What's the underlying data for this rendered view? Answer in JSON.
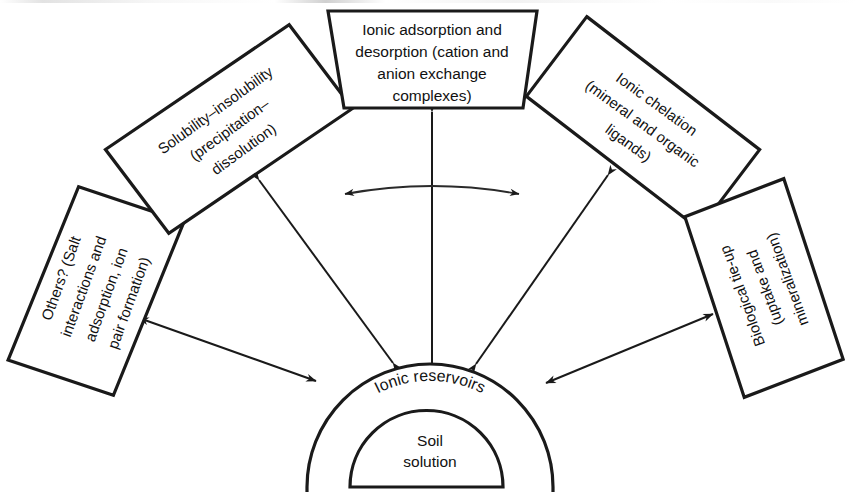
{
  "figure": {
    "type": "relationship-diagram"
  },
  "center": {
    "outer_label": "Ionic reservoirs",
    "inner_label_line1": "Soil",
    "inner_label_line2": "solution"
  },
  "nodes": [
    {
      "id": "others",
      "name": "others-salt-interactions-box",
      "lines": [
        "Others? (Salt",
        "interactions and",
        "adsorption, ion",
        "pair formation)"
      ],
      "rotation": -72
    },
    {
      "id": "solubility",
      "name": "solubility-insolubility-box",
      "lines": [
        "Solubility–insolubility",
        "(precipitation–",
        "dissolution)"
      ],
      "rotation": -36
    },
    {
      "id": "adsorption",
      "name": "ionic-adsorption-desorption-box",
      "lines": [
        "Ionic adsorption and",
        "desorption (cation and",
        "anion exchange",
        "complexes)"
      ],
      "rotation": 0
    },
    {
      "id": "chelation",
      "name": "ionic-chelation-box",
      "lines": [
        "Ionic chelation",
        "(mineral and organic",
        "ligands)"
      ],
      "rotation": 36
    },
    {
      "id": "biological",
      "name": "biological-tie-up-box",
      "lines": [
        "Biological tie-up",
        "(uptake and",
        "mineralization)"
      ],
      "rotation": 72
    }
  ],
  "connectors": [
    {
      "id": "others-link",
      "name": "connector-others-to-reservoir",
      "kind": "double-headed-arrow"
    },
    {
      "id": "solubility-link",
      "name": "connector-solubility-to-reservoir",
      "kind": "double-headed-arrow"
    },
    {
      "id": "adsorption-link",
      "name": "connector-adsorption-to-reservoir",
      "kind": "double-headed-arrow"
    },
    {
      "id": "chelation-link",
      "name": "connector-chelation-to-reservoir",
      "kind": "double-headed-arrow"
    },
    {
      "id": "biological-link",
      "name": "connector-biological-to-reservoir",
      "kind": "double-headed-arrow"
    },
    {
      "id": "lateral-link",
      "name": "connector-lateral-curved-arrow",
      "kind": "curved-double-headed-arrow"
    }
  ],
  "colors": {
    "ink": "#1a1a1a",
    "paper": "#ffffff"
  }
}
